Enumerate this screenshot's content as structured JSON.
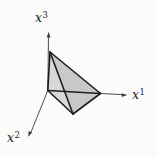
{
  "diagram": {
    "background": "#fbfbfa",
    "axis_color": "#3b3b3b",
    "edge_color": "#1e1e1e",
    "fill_color": "#c7c8ca",
    "light_face_color": "#d7d8d9",
    "label_color": "#222222",
    "labels": {
      "x1": {
        "base": "x",
        "sup": "1"
      },
      "x2": {
        "base": "x",
        "sup": "2"
      },
      "x3": {
        "base": "x",
        "sup": "3"
      }
    },
    "geometry": {
      "axes": {
        "x3_line": "47.8,90.5 48.5,36.5",
        "x1_line": "47.8,90.5 123,94.7",
        "x2_line": "47.8,90.5 30.9,132.4"
      },
      "arrowheads": {
        "x3": "48.6,32 46.7,37.5 50.5,37.5",
        "x1": "127.2,95 121.6,93.2 121.8,97.0",
        "x2": "28.3,136.8 32.2,132.4 28.6,131.0"
      },
      "simplex": {
        "silhouette": "50,52 100.5,93.5 73,114 47.8,90.5",
        "face_left": "50,52 47.8,90.5 73,114",
        "edges": {
          "origin_e3": "47.8,90.5 50,52",
          "origin_e1": "47.8,90.5 100.5,93.5",
          "origin_e2v": "47.8,90.5 73,114",
          "e3_e1": "50,52 100.5,93.5",
          "e3_e2v": "50,52 73,114",
          "e1_e2v": "100.5,93.5 73,114"
        }
      }
    }
  }
}
